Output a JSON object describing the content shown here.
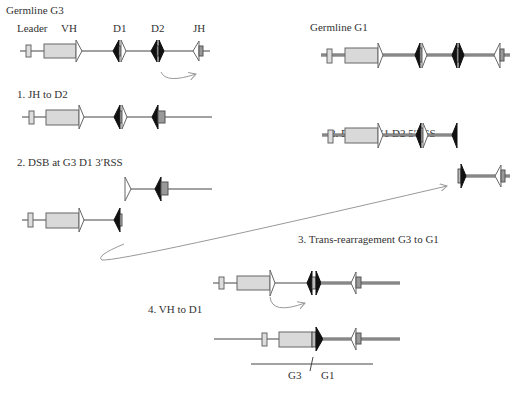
{
  "labels": {
    "germline_g3": "Germline G3",
    "germline_g1": "Germline G1",
    "leader": "Leader",
    "vh": "VH",
    "d1": "D1",
    "d2": "D2",
    "jh": "JH",
    "step1": "1. JH to D2",
    "step2_g3": "2. DSB at G3 D1 3′RSS",
    "step2_g1": "2. DSB at G1 D2 5′RSS",
    "step3": "3. Trans-rearragement G3 to G1",
    "step4": "4. VH to D1",
    "g3": "G3",
    "g1": "G1"
  },
  "colors": {
    "leader_fill": "#dddddd",
    "vh_fill": "#d9d9d9",
    "jh_fill": "#999999",
    "rss_black": "#111111",
    "arrow": "#999999"
  }
}
